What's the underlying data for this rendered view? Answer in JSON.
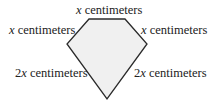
{
  "diagram": {
    "shape": "pentagon",
    "fill": "#f0f0f0",
    "stroke": "#2a2a2a",
    "vertices": [
      [
        89,
        19
      ],
      [
        125,
        19
      ],
      [
        147,
        44
      ],
      [
        107,
        99
      ],
      [
        67,
        44
      ]
    ],
    "labels": {
      "top": {
        "var": "x",
        "text": " centimeters"
      },
      "upper_left": {
        "var": "x",
        "text": " centimeters"
      },
      "upper_right": {
        "var": "x",
        "text": " centimeters"
      },
      "lower_left": {
        "coef": "2",
        "var": "x",
        "text": " centimeters"
      },
      "lower_right": {
        "coef": "2",
        "var": "x",
        "text": " centimeters"
      }
    }
  }
}
